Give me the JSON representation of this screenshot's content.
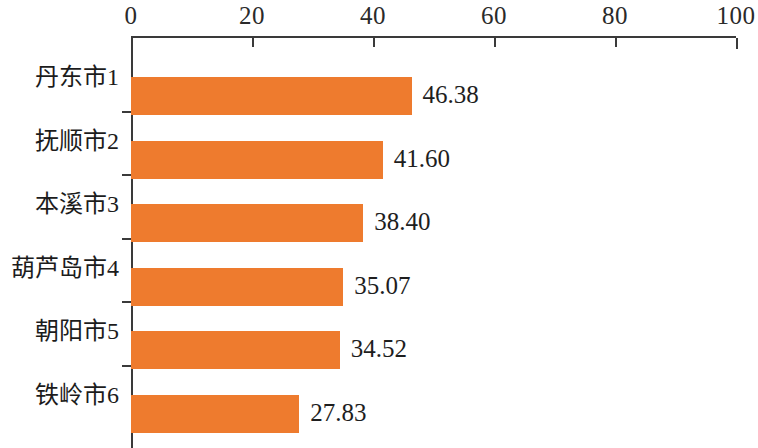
{
  "chart_data": {
    "type": "bar",
    "orientation": "horizontal",
    "title": "",
    "subtitle": "",
    "xlabel": "",
    "ylabel": "",
    "categories": [
      "丹东市1",
      "抚顺市2",
      "本溪市3",
      "葫芦岛市4",
      "朝阳市5",
      "铁岭市6"
    ],
    "values": [
      46.38,
      41.6,
      38.4,
      35.07,
      34.52,
      27.83
    ],
    "value_labels": [
      "46.38",
      "41.60",
      "38.40",
      "35.07",
      "34.52",
      "27.83"
    ],
    "xlim": [
      0,
      100
    ],
    "xticks": [
      0,
      20,
      40,
      60,
      80,
      100
    ],
    "xtick_labels": [
      "0",
      "20",
      "40",
      "60",
      "80",
      "100"
    ],
    "axis_position": "top",
    "grid": false,
    "legend": null,
    "bar_color": "#ee7b2e",
    "axis_color": "#3a3a3a",
    "text_color": "#1c1c1c",
    "background": "#ffffff"
  }
}
